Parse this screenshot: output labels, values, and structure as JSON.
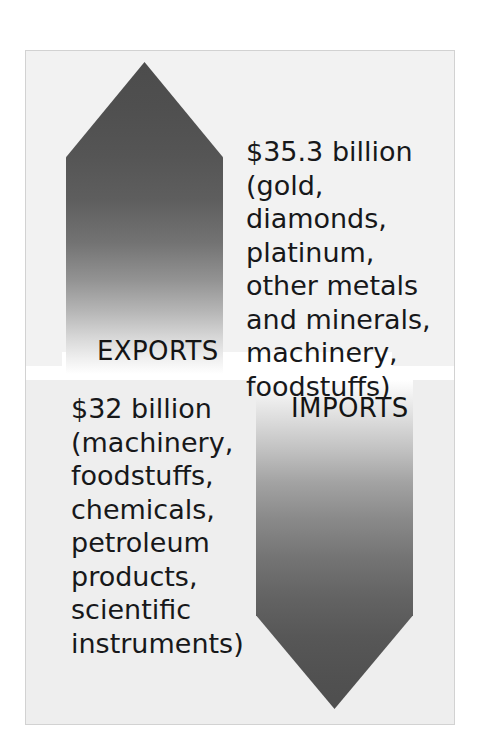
{
  "figure": {
    "frame_color": "#d2d2d2",
    "background": "#f2f2f2"
  },
  "exports": {
    "label": "EXPORTS",
    "amount": "$35.3 billion",
    "direction": "up",
    "gradient_from": "#4c4c4c",
    "gradient_to": "#ffffff",
    "commodities": [
      "gold",
      "diamonds",
      "platinum",
      "other metals and minerals",
      "machinery",
      "foodstuffs"
    ],
    "text": "$35.3 billion\n(gold, diamonds,\nplatinum,\nother metals\nand minerals,\nmachinery,\nfoodstuffs)"
  },
  "imports": {
    "label": "IMPORTS",
    "amount": "$32 billion",
    "direction": "down",
    "gradient_from": "#ffffff",
    "gradient_to": "#4e4e4e",
    "commodities": [
      "machinery",
      "foodstuffs",
      "chemicals",
      "petroleum products",
      "scientific instruments"
    ],
    "text": "$32 billion\n(machinery,\nfoodstuffs,\nchemicals,\npetroleum\nproducts,\nscientific\ninstruments)"
  },
  "chart_data": {
    "type": "bar",
    "categories": [
      "EXPORTS",
      "IMPORTS"
    ],
    "values": [
      35.3,
      32
    ],
    "value_labels": [
      "$35.3 billion",
      "$32 billion"
    ],
    "unit": "billion USD",
    "xlabel": "",
    "ylabel": "",
    "legend": false,
    "grid": false,
    "annotations": [
      "$35.3 billion (gold, diamonds, platinum, other metals and minerals, machinery, foodstuffs)",
      "$32 billion (machinery, foodstuffs, chemicals, petroleum products, scientific instruments)"
    ]
  }
}
